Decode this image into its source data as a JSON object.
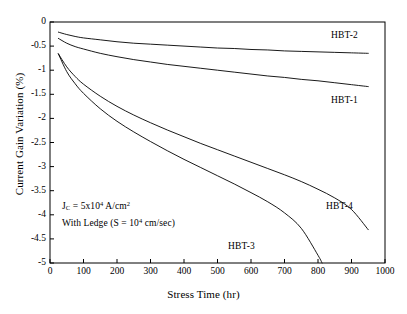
{
  "chart_data": {
    "type": "line",
    "title": "",
    "xlabel": "Stress Time (hr)",
    "ylabel": "Current Gain Variation (%)",
    "xlim": [
      0,
      1000
    ],
    "ylim": [
      -5,
      0
    ],
    "xticks": [
      "0",
      "100",
      "200",
      "300",
      "400",
      "500",
      "600",
      "700",
      "800",
      "900",
      "1000"
    ],
    "yticks": [
      "0",
      "-0.5",
      "-1",
      "-1.5",
      "-2",
      "-2.5",
      "-3",
      "-3.5",
      "-4",
      "-4.5",
      "-5"
    ],
    "grid": false,
    "legend_position": "inline-annotations",
    "series": [
      {
        "name": "HBT-1",
        "x": [
          25,
          50,
          75,
          100,
          150,
          200,
          250,
          300,
          350,
          400,
          450,
          500,
          550,
          600,
          650,
          700,
          750,
          800,
          850,
          900,
          950
        ],
        "y": [
          -0.34,
          -0.44,
          -0.51,
          -0.56,
          -0.65,
          -0.72,
          -0.78,
          -0.83,
          -0.88,
          -0.92,
          -0.96,
          -1.0,
          -1.04,
          -1.08,
          -1.12,
          -1.15,
          -1.19,
          -1.22,
          -1.26,
          -1.3,
          -1.34
        ]
      },
      {
        "name": "HBT-2",
        "x": [
          25,
          50,
          75,
          100,
          150,
          200,
          250,
          300,
          350,
          400,
          450,
          500,
          550,
          600,
          650,
          700,
          750,
          800,
          850,
          900,
          950
        ],
        "y": [
          -0.21,
          -0.26,
          -0.3,
          -0.33,
          -0.37,
          -0.41,
          -0.44,
          -0.46,
          -0.48,
          -0.5,
          -0.52,
          -0.54,
          -0.55,
          -0.57,
          -0.58,
          -0.6,
          -0.61,
          -0.62,
          -0.63,
          -0.64,
          -0.65
        ]
      },
      {
        "name": "HBT-3",
        "x": [
          25,
          50,
          75,
          100,
          150,
          200,
          250,
          300,
          350,
          400,
          450,
          500,
          550,
          600,
          650,
          700,
          750,
          800,
          812
        ],
        "y": [
          -0.66,
          -1.03,
          -1.28,
          -1.48,
          -1.8,
          -2.06,
          -2.28,
          -2.48,
          -2.67,
          -2.85,
          -3.02,
          -3.19,
          -3.36,
          -3.54,
          -3.73,
          -3.96,
          -4.28,
          -4.84,
          -5.0
        ]
      },
      {
        "name": "HBT-4",
        "x": [
          25,
          50,
          75,
          100,
          150,
          200,
          250,
          300,
          350,
          400,
          450,
          500,
          550,
          600,
          650,
          700,
          750,
          800,
          850,
          900,
          950
        ],
        "y": [
          -0.66,
          -0.93,
          -1.13,
          -1.29,
          -1.54,
          -1.75,
          -1.93,
          -2.09,
          -2.24,
          -2.38,
          -2.52,
          -2.65,
          -2.78,
          -2.91,
          -3.04,
          -3.17,
          -3.31,
          -3.47,
          -3.65,
          -3.89,
          -4.31
        ]
      }
    ],
    "curve_labels": [
      {
        "text": "HBT-2",
        "x_px": 331,
        "y_px": 30
      },
      {
        "text": "HBT-1",
        "x_px": 331,
        "y_px": 95
      },
      {
        "text": "HBT-4",
        "x_px": 326,
        "y_px": 201
      },
      {
        "text": "HBT-3",
        "x_px": 228,
        "y_px": 241
      }
    ],
    "annotations": [
      {
        "id": "current-density-note",
        "text": "Jc = 5x104 A/cm2",
        "x_px": 62,
        "y_px": 207
      },
      {
        "id": "ledge-note",
        "text": "With Ledge (S = 104 cm/sec)",
        "x_px": 62,
        "y_px": 224
      }
    ],
    "colors": {
      "axis": "#000000",
      "curve": "#000000",
      "background": "#ffffff"
    }
  },
  "annotation_parts": {
    "jc_j": "J",
    "jc_sub": "C",
    "jc_eq": " = 5x10",
    "jc_sup": "4",
    "jc_unit": " A/cm",
    "jc_unit_sup": "2",
    "ledge_pre": "With Ledge (S = 10",
    "ledge_sup": "4",
    "ledge_post": " cm/sec)"
  }
}
